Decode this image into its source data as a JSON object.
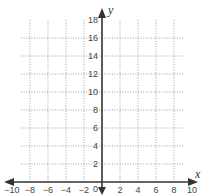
{
  "chart_data": {
    "type": "scatter",
    "title": "",
    "xlabel": "x",
    "ylabel": "y",
    "xlim": [
      -10,
      10
    ],
    "ylim": [
      0,
      18
    ],
    "x_ticks": [
      -10,
      -8,
      -6,
      -4,
      -2,
      0,
      2,
      4,
      6,
      8,
      10
    ],
    "y_ticks": [
      2,
      4,
      6,
      8,
      10,
      12,
      14,
      16,
      18
    ],
    "grid": true,
    "grid_style": "dotted",
    "series": [],
    "legend": null
  },
  "labels": {
    "x_axis": "x",
    "y_axis": "y",
    "origin": "0",
    "x_ticks": [
      "−10",
      "−8",
      "−6",
      "−4",
      "−2",
      "2",
      "4",
      "6",
      "8",
      "10"
    ],
    "y_ticks": [
      "2",
      "4",
      "6",
      "8",
      "10",
      "12",
      "14",
      "16",
      "18"
    ]
  }
}
